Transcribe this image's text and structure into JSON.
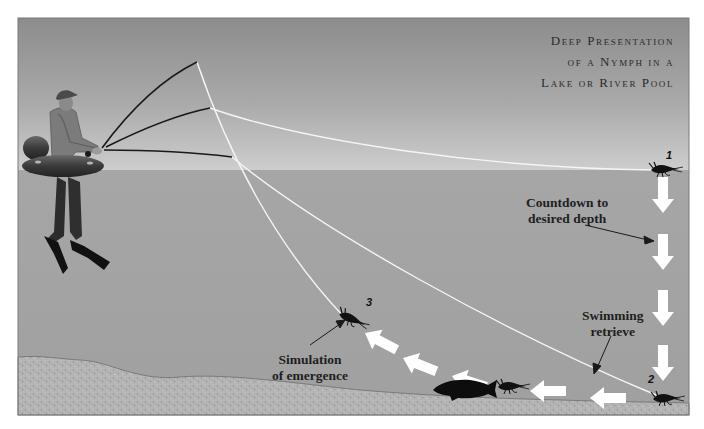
{
  "title": {
    "lines": [
      "Deep Presentation",
      "of a Nymph in a",
      "Lake or River Pool"
    ]
  },
  "annotations": {
    "countdown": {
      "line1": "Countdown to",
      "line2": "desired depth"
    },
    "swimming": {
      "line1": "Swimming",
      "line2": "retrieve"
    },
    "emergence": {
      "line1": "Simulation",
      "line2": "of emergence"
    }
  },
  "markers": {
    "one": "1",
    "two": "2",
    "three": "3"
  },
  "colors": {
    "sky_top": "#8d8d8d",
    "sky_bottom": "#c9c9c9",
    "water": "#a4a4a4",
    "bottom": "#b5b5b5",
    "line": "#f4f4f4",
    "rod": "#1d1d1d",
    "arrow": "#ffffff",
    "silhouette": "#0d0d0d"
  },
  "elements": {
    "angler": "float-tube-angler",
    "fish": "trout-silhouette",
    "nymph": "nymph-fly"
  }
}
